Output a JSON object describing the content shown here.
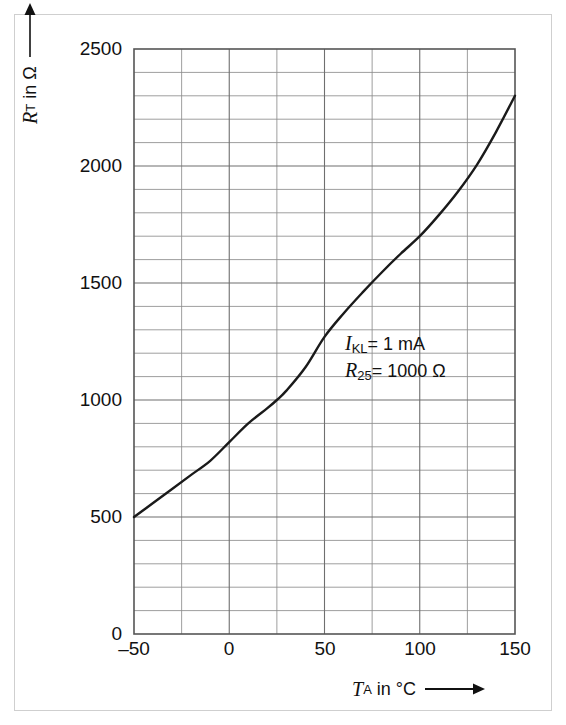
{
  "chart_data": {
    "type": "line",
    "title": "",
    "subtitle": "",
    "xlabel": "T_A in °C",
    "ylabel": "R_T in Ohm",
    "xlim": [
      -50,
      150
    ],
    "ylim": [
      0,
      2500
    ],
    "grid": true,
    "legend_position": "none",
    "x_major_ticks": [
      -50,
      0,
      50,
      100,
      150
    ],
    "x_major_tick_labels": [
      "–50",
      "0",
      "50",
      "100",
      "150"
    ],
    "x_minor_step": 25,
    "y_major_ticks": [
      0,
      500,
      1000,
      1500,
      2000,
      2500
    ],
    "y_major_tick_labels": [
      "0",
      "500",
      "1000",
      "1500",
      "2000",
      "2500"
    ],
    "y_minor_step": 100,
    "series": [
      {
        "name": "R_T(T_A)",
        "color": "#1a1a1a",
        "x": [
          -50,
          -40,
          -30,
          -20,
          -10,
          0,
          10,
          20,
          25,
          30,
          40,
          50,
          60,
          70,
          80,
          90,
          100,
          110,
          120,
          130,
          140,
          150
        ],
        "values": [
          500,
          560,
          620,
          680,
          740,
          820,
          900,
          965,
          1000,
          1040,
          1140,
          1270,
          1370,
          1460,
          1545,
          1625,
          1700,
          1790,
          1890,
          2005,
          2145,
          2300
        ]
      }
    ],
    "annotations": [
      {
        "id": "current",
        "symbol": "I",
        "subscript": "KL",
        "equals": "=",
        "value": "1 mA",
        "x_data": 70,
        "y_data": 1000
      },
      {
        "id": "nominal-resistance",
        "symbol": "R",
        "subscript": "25",
        "equals": "=",
        "value": "1000 Ω",
        "x_data": 70,
        "y_data": 890
      }
    ]
  },
  "axes": {
    "y_title": {
      "symbol": "R",
      "subscript": "T",
      "rest": "in Ω",
      "arrow": "↑"
    },
    "x_title": {
      "symbol": "T",
      "subscript": "A",
      "rest": "in °C",
      "arrow": "→"
    }
  },
  "y_ticks": [
    {
      "label": "2500",
      "value": 2500
    },
    {
      "label": "2000",
      "value": 2000
    },
    {
      "label": "1500",
      "value": 1500
    },
    {
      "label": "1000",
      "value": 1000
    },
    {
      "label": "500",
      "value": 500
    },
    {
      "label": "0",
      "value": 0
    }
  ],
  "x_ticks": [
    {
      "label": "–50",
      "value": -50
    },
    {
      "label": "0",
      "value": 0
    },
    {
      "label": "50",
      "value": 50
    },
    {
      "label": "100",
      "value": 100
    },
    {
      "label": "150",
      "value": 150
    }
  ],
  "colors": {
    "curve": "#1a1a1a",
    "grid_minor": "#8c8c8c",
    "grid_major": "#6f6f6f",
    "axis": "#333333",
    "frame": "#cfcfcf",
    "text": "#111111",
    "background": "#ffffff"
  }
}
